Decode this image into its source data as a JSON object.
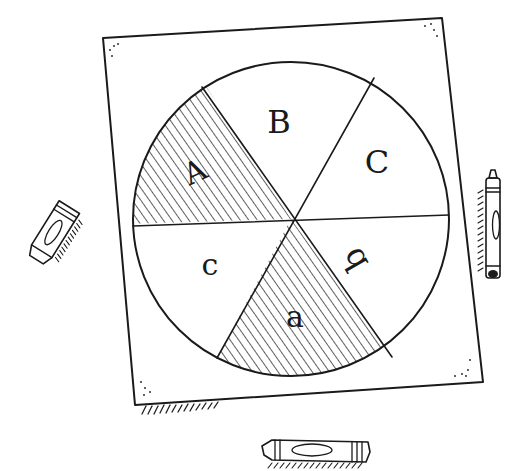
{
  "illustration": {
    "subject": "pie-spinner-game-board-with-crayons",
    "colors": {
      "ink": "#1a1a1a",
      "paper": "#ffffff"
    },
    "wheel": {
      "segments": [
        {
          "label": "A",
          "shaded": true
        },
        {
          "label": "B",
          "shaded": false
        },
        {
          "label": "C",
          "shaded": false
        },
        {
          "label": "b",
          "shaded": false
        },
        {
          "label": "a",
          "shaded": true
        },
        {
          "label": "c",
          "shaded": false
        }
      ]
    },
    "crayons": [
      {
        "position": "left",
        "label": ""
      },
      {
        "position": "right",
        "label": ""
      },
      {
        "position": "bottom",
        "label": ""
      }
    ]
  }
}
